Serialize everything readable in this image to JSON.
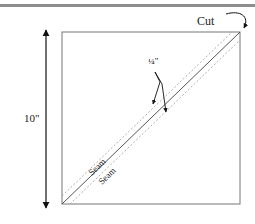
{
  "diagram": {
    "labels": {
      "cut": "Cut",
      "quarter_inch": "¼\"",
      "dimension": "10\"",
      "seam_upper": "Seam",
      "seam_lower": "Seam"
    },
    "square": {
      "x": 62,
      "y": 32,
      "size_label": "10\""
    },
    "colors": {
      "line": "#555555",
      "arrow": "#111111",
      "dashed": "#999999",
      "top_rule": "#8e8e8e",
      "background": "#ffffff"
    }
  }
}
